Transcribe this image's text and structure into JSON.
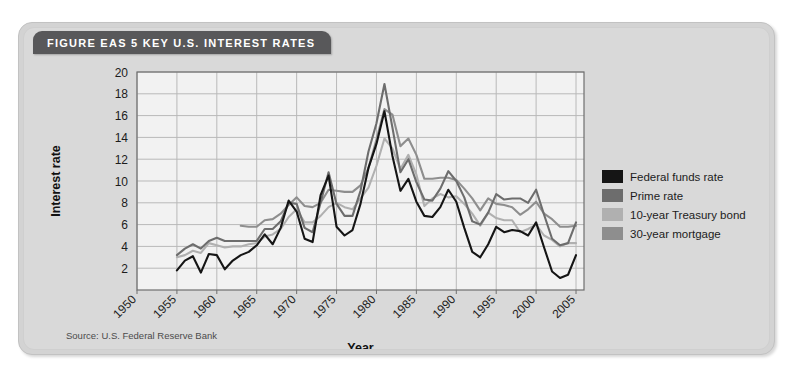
{
  "figure": {
    "title": "FIGURE EAS 5  KEY U.S. INTEREST RATES",
    "source": "Source: U.S. Federal Reserve Bank"
  },
  "colors": {
    "card_bg": "#d3d3d3",
    "title_bar": "#58585a",
    "plot_bg": "#f2f2f2",
    "grid": "#b9b9b9",
    "federal_funds": "#151515",
    "prime": "#6d6d6d",
    "treasury": "#b0b0b0",
    "mortgage": "#8e8e8e"
  },
  "chart_data": {
    "type": "line",
    "title": "KEY U.S. INTEREST RATES",
    "xlabel": "Year",
    "ylabel": "Interest rate",
    "xlim": [
      1950,
      2006
    ],
    "ylim": [
      0,
      20
    ],
    "yticks": [
      2,
      4,
      6,
      8,
      10,
      12,
      14,
      16,
      18,
      20
    ],
    "xticks": [
      1950,
      1955,
      1960,
      1965,
      1970,
      1975,
      1980,
      1985,
      1990,
      1995,
      2000,
      2005
    ],
    "grid": true,
    "legend_position": "right",
    "series": [
      {
        "name": "Federal funds rate",
        "color": "#151515",
        "x": [
          1955,
          1956,
          1957,
          1958,
          1959,
          1960,
          1961,
          1962,
          1963,
          1964,
          1965,
          1966,
          1967,
          1968,
          1969,
          1970,
          1971,
          1972,
          1973,
          1974,
          1975,
          1976,
          1977,
          1978,
          1979,
          1980,
          1981,
          1982,
          1983,
          1984,
          1985,
          1986,
          1987,
          1988,
          1989,
          1990,
          1991,
          1992,
          1993,
          1994,
          1995,
          1996,
          1997,
          1998,
          1999,
          2000,
          2001,
          2002,
          2003,
          2004,
          2005
        ],
        "values": [
          1.8,
          2.7,
          3.1,
          1.6,
          3.3,
          3.2,
          1.9,
          2.7,
          3.2,
          3.5,
          4.1,
          5.1,
          4.2,
          5.7,
          8.2,
          7.2,
          4.7,
          4.4,
          8.7,
          10.5,
          5.8,
          5.0,
          5.5,
          7.9,
          11.2,
          13.4,
          16.4,
          12.3,
          9.1,
          10.2,
          8.1,
          6.8,
          6.7,
          7.6,
          9.2,
          8.1,
          5.7,
          3.5,
          3.0,
          4.2,
          5.8,
          5.3,
          5.5,
          5.4,
          5.0,
          6.2,
          3.9,
          1.7,
          1.1,
          1.4,
          3.2
        ]
      },
      {
        "name": "Prime rate",
        "color": "#6d6d6d",
        "x": [
          1955,
          1956,
          1957,
          1958,
          1959,
          1960,
          1961,
          1962,
          1963,
          1964,
          1965,
          1966,
          1967,
          1968,
          1969,
          1970,
          1971,
          1972,
          1973,
          1974,
          1975,
          1976,
          1977,
          1978,
          1979,
          1980,
          1981,
          1982,
          1983,
          1984,
          1985,
          1986,
          1987,
          1988,
          1989,
          1990,
          1991,
          1992,
          1993,
          1994,
          1995,
          1996,
          1997,
          1998,
          1999,
          2000,
          2001,
          2002,
          2003,
          2004,
          2005
        ],
        "values": [
          3.2,
          3.8,
          4.2,
          3.8,
          4.5,
          4.8,
          4.5,
          4.5,
          4.5,
          4.5,
          4.5,
          5.6,
          5.6,
          6.3,
          8.0,
          7.9,
          5.7,
          5.3,
          8.0,
          10.8,
          7.9,
          6.8,
          6.8,
          9.1,
          12.7,
          15.3,
          18.9,
          14.9,
          10.8,
          12.0,
          9.9,
          8.3,
          8.2,
          9.3,
          10.9,
          10.0,
          8.5,
          6.3,
          6.0,
          7.1,
          8.8,
          8.3,
          8.4,
          8.4,
          8.0,
          9.2,
          6.9,
          4.7,
          4.1,
          4.3,
          6.2
        ]
      },
      {
        "name": "10-year Treasury bond",
        "color": "#b0b0b0",
        "x": [
          1955,
          1956,
          1957,
          1958,
          1959,
          1960,
          1961,
          1962,
          1963,
          1964,
          1965,
          1966,
          1967,
          1968,
          1969,
          1970,
          1971,
          1972,
          1973,
          1974,
          1975,
          1976,
          1977,
          1978,
          1979,
          1980,
          1981,
          1982,
          1983,
          1984,
          1985,
          1986,
          1987,
          1988,
          1989,
          1990,
          1991,
          1992,
          1993,
          1994,
          1995,
          1996,
          1997,
          1998,
          1999,
          2000,
          2001,
          2002,
          2003,
          2004,
          2005
        ],
        "values": [
          3.0,
          3.2,
          3.6,
          3.4,
          4.3,
          4.1,
          3.9,
          4.0,
          4.0,
          4.2,
          4.3,
          4.9,
          5.1,
          5.6,
          6.7,
          7.4,
          6.2,
          6.2,
          6.8,
          7.6,
          8.0,
          7.6,
          7.4,
          8.4,
          9.4,
          11.4,
          13.9,
          13.0,
          11.1,
          12.4,
          10.6,
          7.7,
          8.4,
          8.8,
          8.5,
          8.6,
          7.9,
          7.0,
          5.9,
          7.1,
          6.6,
          6.4,
          6.4,
          5.3,
          5.6,
          6.0,
          5.0,
          4.6,
          4.0,
          4.3,
          4.3
        ]
      },
      {
        "name": "30-year mortgage",
        "color": "#8e8e8e",
        "x": [
          1963,
          1964,
          1965,
          1966,
          1967,
          1968,
          1969,
          1970,
          1971,
          1972,
          1973,
          1974,
          1975,
          1976,
          1977,
          1978,
          1979,
          1980,
          1981,
          1982,
          1983,
          1984,
          1985,
          1986,
          1987,
          1988,
          1989,
          1990,
          1991,
          1992,
          1993,
          1994,
          1995,
          1996,
          1997,
          1998,
          1999,
          2000,
          2001,
          2002,
          2003,
          2004,
          2005
        ],
        "values": [
          5.9,
          5.8,
          5.8,
          6.4,
          6.5,
          7.0,
          7.8,
          8.5,
          7.7,
          7.6,
          8.0,
          9.2,
          9.1,
          9.0,
          9.0,
          9.6,
          11.2,
          13.8,
          16.6,
          16.1,
          13.2,
          13.9,
          12.4,
          10.2,
          10.2,
          10.3,
          10.3,
          10.1,
          9.3,
          8.4,
          7.3,
          8.4,
          7.9,
          7.8,
          7.6,
          6.9,
          7.4,
          8.1,
          7.0,
          6.5,
          5.8,
          5.8,
          5.9
        ]
      }
    ]
  },
  "legend": {
    "items": [
      {
        "label": "Federal funds rate",
        "color": "#151515"
      },
      {
        "label": "Prime rate",
        "color": "#6d6d6d"
      },
      {
        "label": "10-year Treasury bond",
        "color": "#b0b0b0"
      },
      {
        "label": "30-year mortgage",
        "color": "#8e8e8e"
      }
    ]
  }
}
